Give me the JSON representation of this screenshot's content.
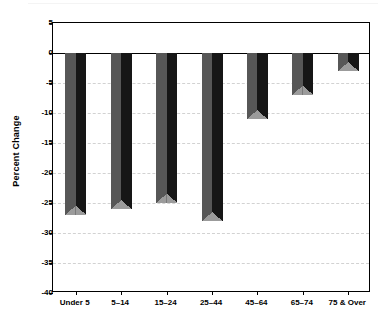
{
  "chart_data": {
    "type": "bar",
    "title": "",
    "xlabel": "",
    "ylabel": "Percent Change",
    "categories": [
      "Under 5",
      "5–14",
      "15–24",
      "25–44",
      "45–64",
      "65–74",
      "75 & Over"
    ],
    "values": [
      -27,
      -26,
      -25,
      -28,
      -11,
      -7,
      -3
    ],
    "series": [
      {
        "name": "Percent Change",
        "values": [
          -27,
          -26,
          -25,
          -28,
          -11,
          -7,
          -3
        ]
      }
    ],
    "ylim": [
      -40,
      5
    ],
    "ytick_labels": [
      "5",
      "0",
      "-5",
      "-10",
      "-15",
      "-20",
      "-25",
      "-30",
      "-35",
      "-40"
    ],
    "ytick_values": [
      5,
      0,
      -5,
      -10,
      -15,
      -20,
      -25,
      -30,
      -35,
      -40
    ],
    "grid": true,
    "grid_style": "dashed",
    "legend": false,
    "legend_position": "none",
    "bar_style": "3d",
    "colors": {
      "bar_left_face": "#575757",
      "bar_right_face": "#161616",
      "bar_bottom_wedge": "#9b9b9b",
      "gridline": "#d2d2d2",
      "axis": "#000000",
      "background": "#ffffff",
      "text": "#000000"
    }
  }
}
